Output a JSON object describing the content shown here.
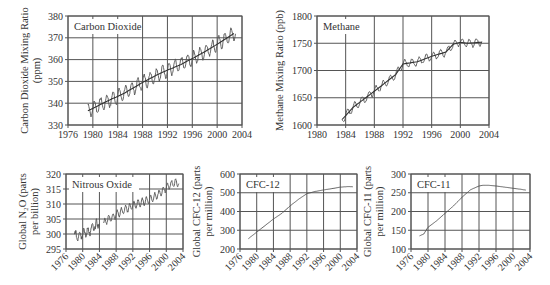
{
  "figure": {
    "panels": 5
  },
  "chart_data": [
    {
      "id": "co2",
      "type": "line",
      "title": "Carbon Dioxide",
      "xlabel": "",
      "ylabel": "Carbon Dioxide Mixing Ratio (ppm)",
      "ylabel_lines": [
        "Carbon Dioxide Mixing Ratio",
        "(ppm)"
      ],
      "xlim": [
        1976,
        2004
      ],
      "ylim": [
        330,
        380
      ],
      "xticks": [
        1976,
        1980,
        1984,
        1988,
        1992,
        1996,
        2000,
        2004
      ],
      "yticks": [
        330,
        340,
        350,
        360,
        370,
        380
      ],
      "xtick_rotation": 0,
      "grid": true,
      "seasonal_amplitude": 3,
      "series": [
        {
          "name": "trend",
          "x": [
            1979.2,
            1982,
            1985,
            1988,
            1991,
            1994,
            1997,
            2000,
            2003
          ],
          "values": [
            336.5,
            340.5,
            344.5,
            349.5,
            354,
            357.5,
            362,
            367,
            372.5
          ]
        }
      ]
    },
    {
      "id": "ch4",
      "type": "line",
      "title": "Methane",
      "xlabel": "",
      "ylabel": "Methane Mixing Ratio (ppb)",
      "ylabel_lines": [
        "Methane Mixing Ratio (ppb)"
      ],
      "xlim": [
        1980,
        2004
      ],
      "ylim": [
        1600,
        1800
      ],
      "xticks": [
        1980,
        1984,
        1988,
        1992,
        1996,
        2000,
        2004
      ],
      "yticks": [
        1600,
        1650,
        1700,
        1750,
        1800
      ],
      "xtick_rotation": 0,
      "grid": true,
      "seasonal_amplitude": 7,
      "series": [
        {
          "name": "trend",
          "x": [
            1983.5,
            1985,
            1987,
            1989,
            1991,
            1992,
            1994,
            1996,
            1998,
            1999,
            2000,
            2001,
            2003
          ],
          "values": [
            1610,
            1632,
            1652,
            1672,
            1693,
            1712,
            1716,
            1726,
            1734,
            1748,
            1752,
            1750,
            1752
          ]
        }
      ]
    },
    {
      "id": "n2o",
      "type": "line",
      "title": "Nitrous Oxide",
      "xlabel": "",
      "ylabel": "Global N2O (parts per billion)",
      "ylabel_lines": [
        "Global N₂O (parts",
        "per billion)"
      ],
      "xlim": [
        1976,
        2004
      ],
      "ylim": [
        295,
        320
      ],
      "xticks": [
        1976,
        1980,
        1984,
        1988,
        1992,
        1996,
        2000,
        2004
      ],
      "yticks": [
        295,
        300,
        305,
        310,
        315,
        320
      ],
      "xtick_rotation": -45,
      "grid": true,
      "seasonal_amplitude": 1.2,
      "series": [
        {
          "name": "early_noisy",
          "x": [
            1978,
            1979,
            1980,
            1981,
            1982,
            1983,
            1984
          ],
          "values": [
            299.5,
            299.5,
            300.5,
            300.5,
            301.5,
            302.5,
            304
          ]
        },
        {
          "name": "later",
          "x": [
            1985,
            1986,
            1987,
            1988,
            1990,
            1992,
            1994,
            1996,
            1998,
            2000,
            2001,
            2002,
            2003
          ],
          "values": [
            303.5,
            305,
            305.5,
            306.5,
            308,
            309.5,
            310.5,
            311.5,
            313,
            315.5,
            316.5,
            317,
            317
          ]
        }
      ]
    },
    {
      "id": "cfc12",
      "type": "line",
      "title": "CFC-12",
      "xlabel": "",
      "ylabel": "Global CFC-12 (parts per million)",
      "ylabel_lines": [
        "Global CFC-12 (parts",
        "per million)"
      ],
      "xlim": [
        1976,
        2004
      ],
      "ylim": [
        200,
        600
      ],
      "xticks": [
        1976,
        1980,
        1984,
        1988,
        1992,
        1996,
        2000,
        2004
      ],
      "yticks": [
        200,
        300,
        400,
        500,
        600
      ],
      "xtick_rotation": -45,
      "grid": true,
      "seasonal_amplitude": 0,
      "series": [
        {
          "name": "cfc12",
          "x": [
            1978,
            1980,
            1982,
            1984,
            1986,
            1988,
            1990,
            1992,
            1994,
            1996,
            1998,
            2000,
            2002,
            2003
          ],
          "values": [
            255,
            290,
            325,
            360,
            390,
            430,
            465,
            495,
            507,
            515,
            522,
            530,
            533,
            532
          ]
        }
      ]
    },
    {
      "id": "cfc11",
      "type": "line",
      "title": "CFC-11",
      "xlabel": "",
      "ylabel": "Global CFC-11 (parts per million)",
      "ylabel_lines": [
        "Global CFC-11 (parts",
        "per million)"
      ],
      "xlim": [
        1976,
        2004
      ],
      "ylim": [
        100,
        300
      ],
      "xticks": [
        1976,
        1980,
        1984,
        1988,
        1992,
        1996,
        2000,
        2004
      ],
      "yticks": [
        100,
        150,
        200,
        250,
        300
      ],
      "xtick_rotation": -45,
      "grid": true,
      "seasonal_amplitude": 0,
      "series": [
        {
          "name": "cfc11",
          "x": [
            1978,
            1979,
            1980,
            1982,
            1984,
            1986,
            1988,
            1990,
            1992,
            1993,
            1994,
            1996,
            1998,
            2000,
            2002,
            2003
          ],
          "values": [
            135,
            140,
            158,
            175,
            195,
            215,
            238,
            258,
            268,
            270,
            270,
            268,
            265,
            262,
            259,
            257
          ]
        }
      ]
    }
  ],
  "layout": {
    "co2": {
      "left": 68,
      "top": 16,
      "right": 242,
      "bottom": 125
    },
    "ch4": {
      "left": 317,
      "top": 16,
      "right": 489,
      "bottom": 125
    },
    "n2o": {
      "left": 66,
      "top": 174,
      "right": 183,
      "bottom": 249
    },
    "cfc12": {
      "left": 240,
      "top": 174,
      "right": 357,
      "bottom": 249
    },
    "cfc11": {
      "left": 411,
      "top": 174,
      "right": 530,
      "bottom": 249
    }
  }
}
